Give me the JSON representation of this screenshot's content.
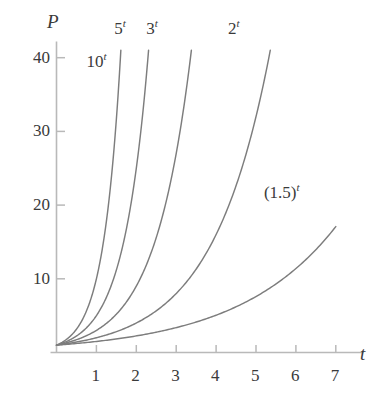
{
  "chart_data": {
    "type": "line",
    "title": "",
    "subtitle": "",
    "xlabel": "t",
    "ylabel": "P",
    "xlim": [
      -0.15,
      7.7
    ],
    "ylim": [
      0,
      43
    ],
    "xticks": [
      1,
      2,
      3,
      4,
      5,
      6,
      7
    ],
    "xtick_labels": [
      "1",
      "2",
      "3",
      "4",
      "5",
      "6",
      "7"
    ],
    "yticks": [
      10,
      20,
      30,
      40
    ],
    "ytick_labels": [
      "10",
      "20",
      "30",
      "40"
    ],
    "grid": false,
    "legend_position": "inline-curve-labels",
    "curve_color": "#7d7d7d",
    "axis_color": "#b9b9b9",
    "text_color": "#3a3a3a",
    "clip_value": 41,
    "series": [
      {
        "name": "10^t",
        "label_base": "10",
        "label_exponent": "t",
        "base": 10,
        "label_x": 1.0,
        "label_y": 39.5,
        "t_end": 1.6,
        "points": [
          {
            "t": 0.0,
            "P": 1.0
          },
          {
            "t": 0.2,
            "P": 1.58
          },
          {
            "t": 0.4,
            "P": 2.51
          },
          {
            "t": 0.6,
            "P": 3.98
          },
          {
            "t": 0.8,
            "P": 6.31
          },
          {
            "t": 1.0,
            "P": 10.0
          },
          {
            "t": 1.2,
            "P": 15.85
          },
          {
            "t": 1.4,
            "P": 25.12
          },
          {
            "t": 1.6,
            "P": 39.81
          }
        ]
      },
      {
        "name": "5^t",
        "label_base": "5",
        "label_exponent": "t",
        "base": 5,
        "label_x": 1.7,
        "label_y": 44.0,
        "t_end": 2.3,
        "points": [
          {
            "t": 0.0,
            "P": 1.0
          },
          {
            "t": 0.5,
            "P": 2.24
          },
          {
            "t": 1.0,
            "P": 5.0
          },
          {
            "t": 1.5,
            "P": 11.18
          },
          {
            "t": 2.0,
            "P": 25.0
          },
          {
            "t": 2.3,
            "P": 40.52
          }
        ]
      },
      {
        "name": "3^t",
        "label_base": "3",
        "label_exponent": "t",
        "base": 3,
        "label_x": 2.5,
        "label_y": 44.0,
        "t_end": 3.38,
        "points": [
          {
            "t": 0.0,
            "P": 1.0
          },
          {
            "t": 0.5,
            "P": 1.73
          },
          {
            "t": 1.0,
            "P": 3.0
          },
          {
            "t": 1.5,
            "P": 5.2
          },
          {
            "t": 2.0,
            "P": 9.0
          },
          {
            "t": 2.5,
            "P": 15.59
          },
          {
            "t": 3.0,
            "P": 27.0
          },
          {
            "t": 3.38,
            "P": 41.0
          }
        ]
      },
      {
        "name": "2^t",
        "label_base": "2",
        "label_exponent": "t",
        "base": 2,
        "label_x": 4.55,
        "label_y": 44.0,
        "t_end": 5.35,
        "points": [
          {
            "t": 0.0,
            "P": 1.0
          },
          {
            "t": 1.0,
            "P": 2.0
          },
          {
            "t": 2.0,
            "P": 4.0
          },
          {
            "t": 3.0,
            "P": 8.0
          },
          {
            "t": 4.0,
            "P": 16.0
          },
          {
            "t": 5.0,
            "P": 32.0
          },
          {
            "t": 5.35,
            "P": 40.8
          }
        ]
      },
      {
        "name": "(1.5)^t",
        "label_base": "(1.5)",
        "label_exponent": "t",
        "base": 1.5,
        "label_x": 5.45,
        "label_y": 21.8,
        "t_end": 7.0,
        "points": [
          {
            "t": 0.0,
            "P": 1.0
          },
          {
            "t": 1.0,
            "P": 1.5
          },
          {
            "t": 2.0,
            "P": 2.25
          },
          {
            "t": 3.0,
            "P": 3.38
          },
          {
            "t": 4.0,
            "P": 5.06
          },
          {
            "t": 5.0,
            "P": 7.59
          },
          {
            "t": 6.0,
            "P": 11.39
          },
          {
            "t": 7.0,
            "P": 17.09
          }
        ]
      }
    ]
  }
}
